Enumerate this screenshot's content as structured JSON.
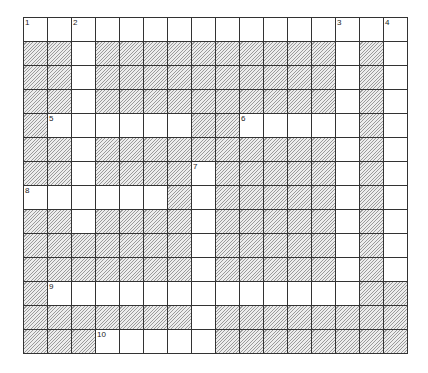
{
  "puzzle": {
    "rows": 14,
    "cols": 16,
    "colors": {
      "block_bg": "#ececec",
      "block_hatch": "#9a9a9a",
      "grid_line": "#333333",
      "cell_bg": "#ffffff"
    },
    "layout": [
      "................",
      "##.##########.#.",
      "##.##########.#.",
      "##.##########.#.",
      "#......##.....#.",
      "##.##########.#.",
      "##.####.#####.#.",
      "......#.#####.#.",
      "##.####.#####.#.",
      "#######.#####.#.",
      "#######.#####.#.",
      "#.............##",
      "#######.########",
      "###.....########"
    ],
    "numbers": [
      {
        "row": 0,
        "col": 0,
        "label": "1"
      },
      {
        "row": 0,
        "col": 2,
        "label": "2"
      },
      {
        "row": 0,
        "col": 13,
        "label": "3"
      },
      {
        "row": 0,
        "col": 15,
        "label": "4"
      },
      {
        "row": 4,
        "col": 1,
        "label": "5"
      },
      {
        "row": 4,
        "col": 9,
        "label": "6"
      },
      {
        "row": 6,
        "col": 7,
        "label": "7"
      },
      {
        "row": 7,
        "col": 0,
        "label": "8"
      },
      {
        "row": 11,
        "col": 1,
        "label": "9"
      },
      {
        "row": 13,
        "col": 3,
        "label": "10"
      }
    ]
  }
}
